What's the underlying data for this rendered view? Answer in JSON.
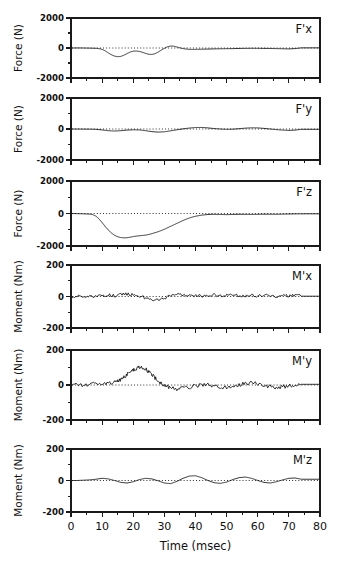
{
  "figure": {
    "xaxis_title": "Time (msec)",
    "x_tick_labels": [
      "0",
      "10",
      "20",
      "30",
      "40",
      "50",
      "60",
      "70",
      "80"
    ],
    "force_axis_label": "Force (N)",
    "moment_axis_label": "Moment (Nm)",
    "force_tick_labels": [
      "2000",
      "0",
      "-2000"
    ],
    "moment_tick_labels": [
      "200",
      "0",
      "-200"
    ],
    "panel_labels": [
      "F'x",
      "F'y",
      "F'z",
      "M'x",
      "M'y",
      "M'z"
    ]
  },
  "chart_data": {
    "type": "line",
    "title": "",
    "xlabel": "Time (msec)",
    "xlim": [
      0,
      80
    ],
    "x_ticks": [
      0,
      10,
      20,
      30,
      40,
      50,
      60,
      70,
      80
    ],
    "x_minor_ticks": [
      5,
      15,
      25,
      35,
      45,
      55,
      65,
      75
    ],
    "grid": false,
    "legend": "none",
    "zero_reference_line": true,
    "panels": [
      {
        "name": "F'x",
        "ylabel": "Force (N)",
        "ylim": [
          -2000,
          2000
        ],
        "y_ticks": [
          2000,
          0,
          -2000
        ],
        "y_minor_ticks": [
          1000,
          -1000
        ],
        "x": [
          0,
          2,
          4,
          6,
          8,
          9,
          10,
          11,
          12,
          13,
          14,
          15,
          16,
          17,
          18,
          19,
          20,
          21,
          22,
          23,
          24,
          25,
          26,
          27,
          28,
          29,
          30,
          31,
          32,
          33,
          34,
          35,
          36,
          37,
          38,
          39,
          40,
          42,
          44,
          46,
          48,
          50,
          52,
          54,
          56,
          58,
          60,
          62,
          64,
          66,
          68,
          70,
          72,
          74
        ],
        "y": [
          0,
          5,
          0,
          -10,
          -20,
          -40,
          -90,
          -190,
          -330,
          -450,
          -540,
          -580,
          -560,
          -480,
          -370,
          -270,
          -210,
          -200,
          -230,
          -290,
          -360,
          -420,
          -430,
          -380,
          -270,
          -140,
          -20,
          80,
          130,
          120,
          70,
          10,
          -40,
          -70,
          -90,
          -95,
          -90,
          -80,
          -70,
          -60,
          -50,
          -45,
          -40,
          -30,
          -25,
          -20,
          -20,
          -25,
          -30,
          -40,
          -50,
          -60,
          -40,
          10
        ]
      },
      {
        "name": "F'y",
        "ylabel": "Force (N)",
        "ylim": [
          -2000,
          2000
        ],
        "y_ticks": [
          2000,
          0,
          -2000
        ],
        "y_minor_ticks": [
          1000,
          -1000
        ],
        "x": [
          0,
          3,
          6,
          8,
          10,
          12,
          14,
          16,
          18,
          20,
          22,
          24,
          26,
          28,
          30,
          32,
          34,
          36,
          38,
          40,
          42,
          44,
          46,
          48,
          50,
          52,
          54,
          56,
          58,
          60,
          62,
          64,
          66,
          68,
          70,
          72,
          74
        ],
        "y": [
          0,
          -5,
          -10,
          -20,
          -60,
          -110,
          -130,
          -110,
          -70,
          -50,
          -60,
          -110,
          -170,
          -200,
          -180,
          -120,
          -50,
          10,
          60,
          95,
          100,
          70,
          30,
          0,
          -20,
          -10,
          20,
          55,
          75,
          70,
          40,
          0,
          -40,
          -70,
          -90,
          -70,
          -20
        ]
      },
      {
        "name": "F'z",
        "ylabel": "Force (N)",
        "ylim": [
          -2000,
          2000
        ],
        "y_ticks": [
          2000,
          0,
          -2000
        ],
        "y_minor_ticks": [
          1000,
          -1000
        ],
        "x": [
          0,
          2,
          4,
          6,
          7,
          8,
          9,
          10,
          11,
          12,
          13,
          14,
          15,
          16,
          17,
          18,
          19,
          20,
          21,
          22,
          23,
          24,
          25,
          26,
          27,
          28,
          29,
          30,
          31,
          32,
          33,
          34,
          35,
          36,
          37,
          38,
          39,
          40,
          42,
          44,
          46,
          48,
          50,
          52,
          54,
          56,
          58,
          60,
          62,
          64,
          66,
          68,
          70,
          72,
          74
        ],
        "y": [
          0,
          -10,
          -20,
          -40,
          -70,
          -160,
          -330,
          -560,
          -800,
          -1020,
          -1200,
          -1340,
          -1430,
          -1480,
          -1500,
          -1490,
          -1460,
          -1420,
          -1390,
          -1370,
          -1350,
          -1330,
          -1290,
          -1240,
          -1180,
          -1120,
          -1050,
          -970,
          -880,
          -790,
          -700,
          -610,
          -520,
          -430,
          -350,
          -280,
          -220,
          -170,
          -100,
          -60,
          -50,
          -60,
          -70,
          -60,
          -50,
          -55,
          -60,
          -50,
          -40,
          -45,
          -50,
          -40,
          -30,
          -25,
          -20
        ],
        "peak_min_value": -1500,
        "peak_min_time": 17
      },
      {
        "name": "M'x",
        "ylabel": "Moment (Nm)",
        "ylim": [
          -200,
          200
        ],
        "y_ticks": [
          200,
          0,
          -200
        ],
        "y_minor_ticks": [
          100,
          -100
        ],
        "noise_amplitude": 9,
        "x": [
          0,
          2,
          4,
          6,
          8,
          10,
          12,
          14,
          16,
          18,
          20,
          22,
          24,
          26,
          28,
          30,
          32,
          34,
          36,
          38,
          40,
          42,
          44,
          46,
          48,
          50,
          52,
          54,
          56,
          58,
          60,
          62,
          64,
          66,
          68,
          70,
          72,
          74
        ],
        "y": [
          0,
          2,
          -4,
          5,
          -3,
          6,
          10,
          4,
          12,
          16,
          10,
          4,
          -10,
          -18,
          -22,
          -14,
          6,
          18,
          10,
          4,
          8,
          2,
          6,
          10,
          4,
          8,
          12,
          6,
          2,
          8,
          4,
          10,
          6,
          2,
          8,
          4,
          10,
          2
        ]
      },
      {
        "name": "M'y",
        "ylabel": "Moment (Nm)",
        "ylim": [
          -200,
          200
        ],
        "y_ticks": [
          200,
          0,
          -200
        ],
        "y_minor_ticks": [
          100,
          -100
        ],
        "noise_amplitude": 11,
        "x": [
          0,
          2,
          4,
          6,
          8,
          10,
          12,
          14,
          15,
          16,
          17,
          18,
          19,
          20,
          21,
          22,
          23,
          24,
          25,
          26,
          27,
          28,
          29,
          30,
          31,
          32,
          34,
          36,
          38,
          40,
          42,
          44,
          46,
          48,
          50,
          52,
          54,
          56,
          58,
          60,
          62,
          64,
          66,
          68,
          70,
          72,
          74
        ],
        "y": [
          0,
          4,
          -2,
          6,
          4,
          8,
          10,
          14,
          20,
          30,
          44,
          60,
          76,
          88,
          96,
          100,
          98,
          90,
          76,
          58,
          40,
          24,
          10,
          0,
          -8,
          -16,
          -22,
          -20,
          -12,
          -6,
          -2,
          4,
          -8,
          -16,
          -12,
          -6,
          2,
          8,
          12,
          6,
          -4,
          -10,
          -14,
          -10,
          -6,
          -2,
          4
        ],
        "peak_max_value": 100,
        "peak_max_time": 22
      },
      {
        "name": "M'z",
        "ylabel": "Moment (Nm)",
        "ylim": [
          -200,
          200
        ],
        "y_ticks": [
          200,
          0,
          -200
        ],
        "y_minor_ticks": [
          100,
          -100
        ],
        "x": [
          0,
          2,
          4,
          6,
          8,
          10,
          12,
          14,
          16,
          18,
          20,
          22,
          24,
          26,
          28,
          30,
          32,
          34,
          36,
          38,
          40,
          42,
          44,
          46,
          48,
          50,
          52,
          54,
          56,
          58,
          60,
          62,
          64,
          66,
          68,
          70,
          72,
          74
        ],
        "y": [
          0,
          0,
          2,
          4,
          8,
          14,
          10,
          0,
          -12,
          -16,
          -8,
          6,
          14,
          10,
          -2,
          -16,
          -20,
          -6,
          14,
          28,
          30,
          18,
          0,
          -14,
          -18,
          -10,
          6,
          18,
          22,
          14,
          0,
          -12,
          -16,
          -8,
          4,
          14,
          16,
          8
        ]
      }
    ]
  }
}
